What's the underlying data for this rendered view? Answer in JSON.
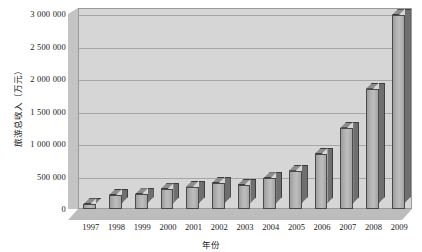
{
  "chart_data": {
    "type": "bar",
    "title": "",
    "xlabel": "年份",
    "ylabel": "旅游总收入（万元）",
    "categories": [
      "1997",
      "1998",
      "1999",
      "2000",
      "2001",
      "2002",
      "2003",
      "2004",
      "2005",
      "2006",
      "2007",
      "2008",
      "2009"
    ],
    "values": [
      75000,
      215000,
      225000,
      305000,
      345000,
      400000,
      370000,
      470000,
      590000,
      845000,
      1250000,
      1850000,
      2980000
    ],
    "ylim": [
      0,
      3000000
    ],
    "ytick_values": [
      0,
      500000,
      1000000,
      1500000,
      2000000,
      2500000,
      3000000
    ],
    "ytick_labels": [
      "0",
      "500 000",
      "1 000 000",
      "1 500 000",
      "2 000 000",
      "2 500 000",
      "3 000 000"
    ],
    "grid": true,
    "legend": "none",
    "style": "3d-column",
    "colors": {
      "bar_front": "#b4b4b4",
      "bar_side": "#6f6f6f",
      "bar_top": "#8d8d8d",
      "bar_outline": "#3d3d3d",
      "plot_background": "#d6d6d6",
      "wall_left": "#c4c4c4",
      "floor": "#bdbdbd",
      "gridline": "#a6a6a6",
      "page_background": "#ffffff",
      "text": "#1a1a1a"
    }
  }
}
